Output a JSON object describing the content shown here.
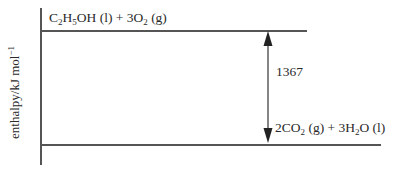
{
  "diagram": {
    "type": "enthalpy-level-diagram",
    "y_axis_label": {
      "text": "enthalpy/kJ mol",
      "superscript": "−1"
    },
    "top_level": {
      "label_parts": [
        {
          "t": "C"
        },
        {
          "sub": "2"
        },
        {
          "t": "H"
        },
        {
          "sub": "5"
        },
        {
          "t": "OH (l) + 3O"
        },
        {
          "sub": "2"
        },
        {
          "t": " (g)"
        }
      ],
      "label_plain": "C2H5OH (l) + 3O2 (g)"
    },
    "bottom_level": {
      "label_parts": [
        {
          "t": "2CO"
        },
        {
          "sub": "2"
        },
        {
          "t": " (g) + 3H"
        },
        {
          "sub": "2"
        },
        {
          "t": "O (l)"
        }
      ],
      "label_plain": "2CO2 (g) + 3H2O (l)"
    },
    "arrow": {
      "value": "1367",
      "direction": "double-headed"
    },
    "colors": {
      "line": "#555555",
      "text": "#2a2a2a"
    }
  }
}
